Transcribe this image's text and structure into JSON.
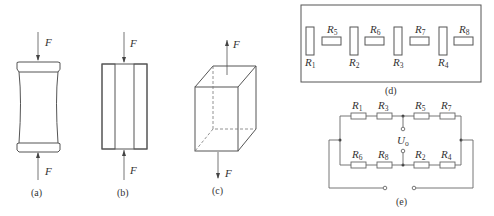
{
  "figure": {
    "panels": {
      "a": {
        "caption": "(a)",
        "description": "barrel-shaped column under compression",
        "force_top": "F",
        "force_bottom": "F"
      },
      "b": {
        "caption": "(b)",
        "description": "hollow tube section under compression (hatched walls)",
        "force_top": "F",
        "force_bottom": "F"
      },
      "c": {
        "caption": "(c)",
        "description": "rectangular prism under tension",
        "force_top": "F",
        "force_bottom": "F"
      },
      "d": {
        "caption": "(d)",
        "description": "strain gauge layout",
        "resistors": [
          {
            "main": "R",
            "sub": "1"
          },
          {
            "main": "R",
            "sub": "5"
          },
          {
            "main": "R",
            "sub": "2"
          },
          {
            "main": "R",
            "sub": "6"
          },
          {
            "main": "R",
            "sub": "3"
          },
          {
            "main": "R",
            "sub": "7"
          },
          {
            "main": "R",
            "sub": "4"
          },
          {
            "main": "R",
            "sub": "8"
          }
        ]
      },
      "e": {
        "caption": "(e)",
        "description": "bridge circuit",
        "top_branch": [
          {
            "main": "R",
            "sub": "1"
          },
          {
            "main": "R",
            "sub": "3"
          },
          {
            "main": "R",
            "sub": "5"
          },
          {
            "main": "R",
            "sub": "7"
          }
        ],
        "bottom_branch": [
          {
            "main": "R",
            "sub": "6"
          },
          {
            "main": "R",
            "sub": "8"
          },
          {
            "main": "R",
            "sub": "2"
          },
          {
            "main": "R",
            "sub": "4"
          }
        ],
        "output": {
          "main": "U",
          "sub": "o"
        }
      }
    }
  }
}
